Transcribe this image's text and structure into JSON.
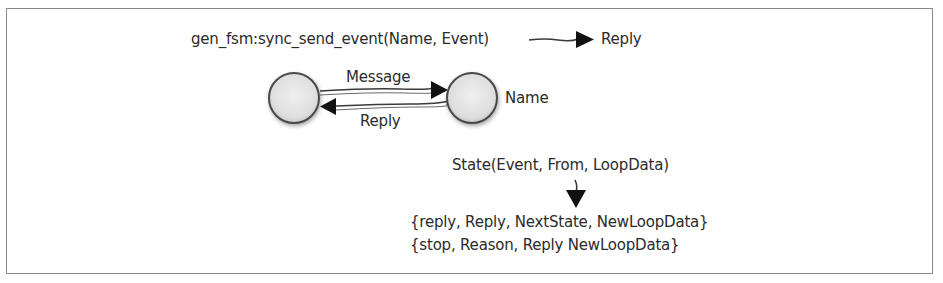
{
  "diagram": {
    "top_call": "gen_fsm:sync_send_event(Name, Event)",
    "top_result": "Reply",
    "edge_message": "Message",
    "edge_reply": "Reply",
    "node_right_label": "Name",
    "callback": "State(Event, From, LoopData)",
    "returns": [
      "{reply, Reply, NextState, NewLoopData}",
      "{stop, Reason, Reply NewLoopData}"
    ],
    "colors": {
      "border": "#8a8a8a",
      "node_fill": "#e6e6e6",
      "node_stroke": "#4a4a4a",
      "ink": "#1a1a1a"
    }
  }
}
